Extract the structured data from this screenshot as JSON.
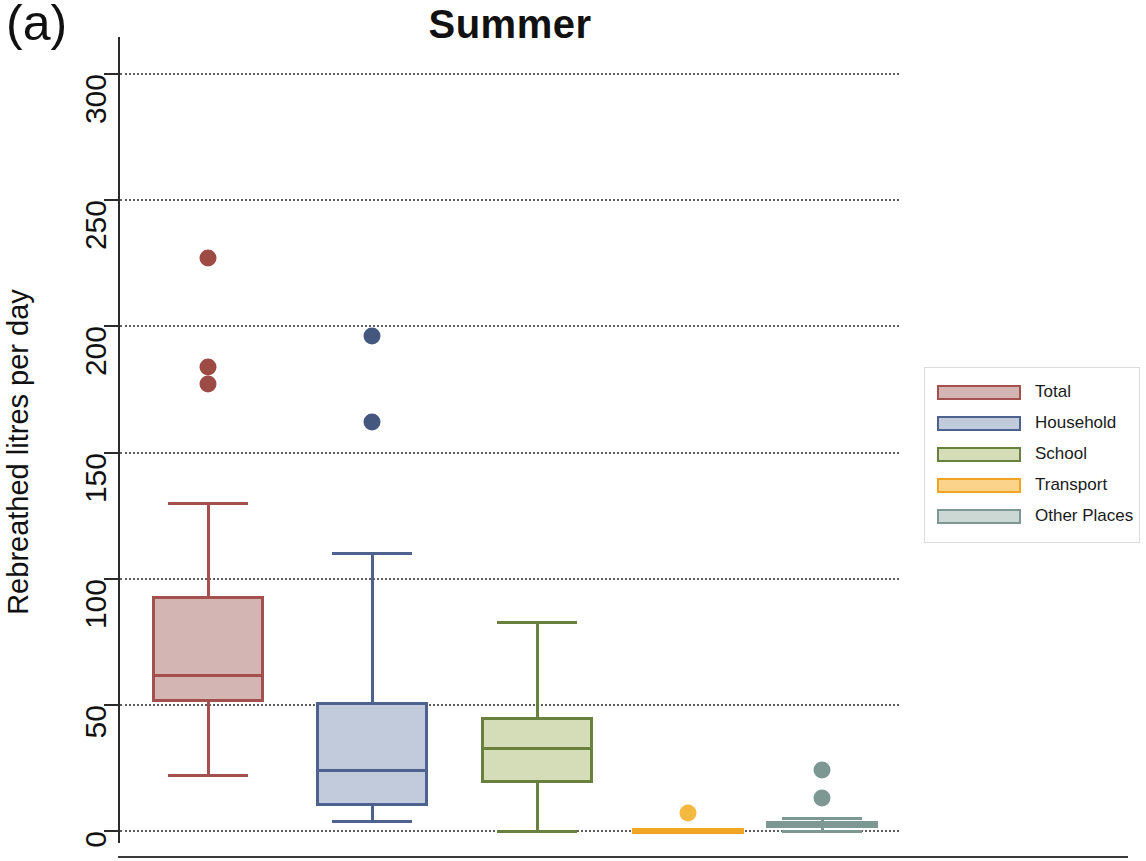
{
  "panel_label": "(a)",
  "title": "Summer",
  "axis": {
    "y_title": "Rebreathed litres per day",
    "y_ticks": [
      0,
      50,
      100,
      150,
      200,
      250,
      300
    ],
    "y_min": 0,
    "y_max": 300
  },
  "legend": {
    "items": [
      {
        "label": "Total",
        "fill": "#d3b5b3",
        "stroke": "#a4504c"
      },
      {
        "label": "Household",
        "fill": "#c2cbdb",
        "stroke": "#4e628f"
      },
      {
        "label": "School",
        "fill": "#d5dcb8",
        "stroke": "#68813f"
      },
      {
        "label": "Transport",
        "fill": "#fbd38a",
        "stroke": "#f0a523"
      },
      {
        "label": "Other Places",
        "fill": "#cbd8d4",
        "stroke": "#7d9793"
      }
    ]
  },
  "chart_data": {
    "type": "box",
    "title": "Summer",
    "xlabel": "",
    "ylabel": "Rebreathed litres per day",
    "ylim": [
      0,
      300
    ],
    "yticks": [
      0,
      50,
      100,
      150,
      200,
      250,
      300
    ],
    "grid": "horizontal-dotted",
    "legend_position": "right",
    "categories": [
      "Total",
      "Household",
      "School",
      "Transport",
      "Other Places"
    ],
    "boxes": [
      {
        "name": "Total",
        "whisker_low": 22,
        "q1": 51,
        "median": 62,
        "q3": 93,
        "whisker_high": 130,
        "outliers": [
          227,
          184,
          177
        ],
        "fill": "#d3b5b3",
        "stroke": "#a4504c",
        "outlier_color": "#9c4b45"
      },
      {
        "name": "Household",
        "whisker_low": 4,
        "q1": 10,
        "median": 24,
        "q3": 51,
        "whisker_high": 110,
        "outliers": [
          196,
          162
        ],
        "fill": "#c2cbdb",
        "stroke": "#4e628f",
        "outlier_color": "#44577f"
      },
      {
        "name": "School",
        "whisker_low": 0,
        "q1": 19,
        "median": 33,
        "q3": 45,
        "whisker_high": 83,
        "outliers": [],
        "fill": "#d5dcb8",
        "stroke": "#68813f",
        "outlier_color": "#68813f"
      },
      {
        "name": "Transport",
        "whisker_low": 0,
        "q1": 0,
        "median": 0,
        "q3": 0.5,
        "whisker_high": 0.5,
        "outliers": [
          7
        ],
        "fill": "#fbd38a",
        "stroke": "#f0a523",
        "outlier_color": "#f5b942"
      },
      {
        "name": "Other Places",
        "whisker_low": 0,
        "q1": 1,
        "median": 3,
        "q3": 4,
        "whisker_high": 5,
        "outliers": [
          24,
          13
        ],
        "fill": "#cbd8d4",
        "stroke": "#7d9793",
        "outlier_color": "#7d9793"
      }
    ]
  }
}
